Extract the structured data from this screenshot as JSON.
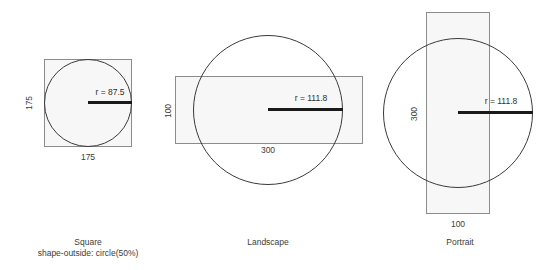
{
  "page": {
    "background": "#ffffff",
    "box_fill": "#f7f7f7",
    "box_stroke": "#8c8c8c",
    "circle_stroke": "#3a3a3a",
    "radius_stroke": "#1a1a1a",
    "text_color": "#3c3c3c"
  },
  "figures": [
    {
      "id": "square",
      "caption": "Square",
      "caption_sub": "shape-outside: circle(50%)",
      "radius_label": "r = 87.5",
      "width_label": "175",
      "height_label": "175"
    },
    {
      "id": "landscape",
      "caption": "Landscape",
      "caption_sub": "",
      "radius_label": "r = 111.8",
      "width_label": "300",
      "height_label": "100"
    },
    {
      "id": "portrait",
      "caption": "Portrait",
      "caption_sub": "",
      "radius_label": "r = 111.8",
      "width_label": "100",
      "height_label": "300"
    }
  ]
}
